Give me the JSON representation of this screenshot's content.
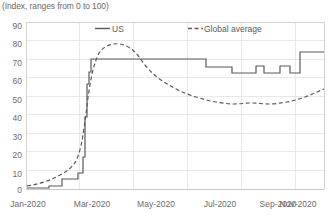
{
  "subtitle": "(Index, ranges from 0 to 100)",
  "legend": {
    "us_label": "US",
    "global_label": "Global average"
  },
  "chart_data": {
    "type": "line",
    "title": "",
    "subtitle": "(Index, ranges from 0 to 100)",
    "xlabel": "",
    "ylabel": "",
    "ylim": [
      0,
      90
    ],
    "yticks": [
      0,
      10,
      20,
      30,
      40,
      50,
      60,
      70,
      80,
      90
    ],
    "xticks": [
      "Jan-2020",
      "Mar-2020",
      "May-2020",
      "Jul-2020",
      "Sep-2020",
      "Nov-2020"
    ],
    "xlim": [
      "2020-01-01",
      "2020-12-15"
    ],
    "grid": true,
    "legend_position": "top-center",
    "series": [
      {
        "name": "US",
        "style": "solid-step",
        "color": "#595959",
        "x": [
          "2020-01-01",
          "2020-01-15",
          "2020-02-01",
          "2020-02-10",
          "2020-02-20",
          "2020-02-29",
          "2020-03-05",
          "2020-03-12",
          "2020-03-16",
          "2020-03-19",
          "2020-03-22",
          "2020-03-25",
          "2020-03-28",
          "2020-04-01",
          "2020-04-15",
          "2020-05-01",
          "2020-05-15",
          "2020-06-01",
          "2020-06-10",
          "2020-06-20",
          "2020-07-01",
          "2020-07-15",
          "2020-08-01",
          "2020-08-15",
          "2020-09-01",
          "2020-09-10",
          "2020-09-20",
          "2020-10-01",
          "2020-10-10",
          "2020-10-20",
          "2020-11-01",
          "2020-11-10",
          "2020-11-20",
          "2020-12-01",
          "2020-12-15"
        ],
        "values": [
          1,
          1,
          1,
          2,
          2,
          2,
          6,
          6,
          9,
          17,
          40,
          58,
          66,
          72,
          72,
          72,
          72,
          72,
          72,
          72,
          72,
          72,
          67,
          67,
          64,
          64,
          64,
          60,
          60,
          64,
          60,
          60,
          60,
          76,
          76
        ]
      },
      {
        "name": "Global average",
        "style": "dashed-smooth",
        "color": "#595959",
        "x": [
          "2020-01-01",
          "2020-01-15",
          "2020-02-01",
          "2020-02-15",
          "2020-03-01",
          "2020-03-10",
          "2020-03-20",
          "2020-03-28",
          "2020-04-05",
          "2020-04-15",
          "2020-04-25",
          "2020-05-05",
          "2020-05-15",
          "2020-06-01",
          "2020-06-15",
          "2020-07-01",
          "2020-07-15",
          "2020-08-01",
          "2020-08-15",
          "2020-09-01",
          "2020-09-15",
          "2020-10-01",
          "2020-10-15",
          "2020-11-01",
          "2020-11-15",
          "2020-12-01",
          "2020-12-15"
        ],
        "values": [
          2,
          3,
          5,
          7,
          10,
          16,
          38,
          63,
          75,
          79,
          80,
          79,
          74,
          67,
          64,
          62,
          60,
          57,
          56,
          54,
          53,
          52,
          52,
          53,
          53,
          54,
          55
        ]
      }
    ]
  }
}
